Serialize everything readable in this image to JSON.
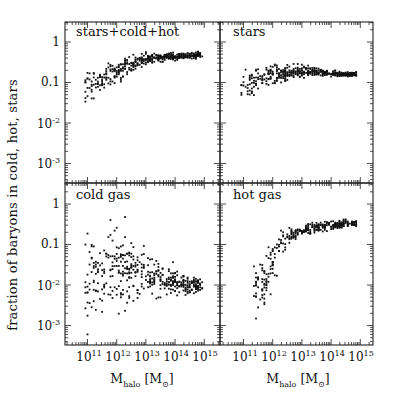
{
  "chart_data": {
    "type": "scatter",
    "layout": "2x2 panels, shared axes",
    "ylabel": "fraction of baryons in cold, hot, stars",
    "xlabel": "M_halo [M_sun]",
    "xscale": "log",
    "yscale": "log",
    "xlim": [
      30000000000.0,
      1000000000000000.0
    ],
    "ylim": [
      0.0003,
      3
    ],
    "x_ticks": [
      "10^11",
      "10^12",
      "10^13",
      "10^14",
      "10^15"
    ],
    "y_ticks": [
      "1",
      "0.1",
      "10^-2",
      "10^-3"
    ],
    "panels": [
      {
        "name": "stars+cold+hot",
        "position": "top-left",
        "trend_log10M": [
          10.9,
          11.5,
          12.0,
          12.5,
          13.0,
          13.5,
          14.0,
          14.5,
          14.9
        ],
        "trend_median": [
          0.08,
          0.12,
          0.18,
          0.27,
          0.38,
          0.42,
          0.45,
          0.47,
          0.48
        ],
        "scatter_dex": [
          0.2,
          0.18,
          0.15,
          0.1,
          0.08,
          0.06,
          0.05,
          0.04,
          0.04
        ]
      },
      {
        "name": "stars",
        "position": "top-right",
        "trend_log10M": [
          10.9,
          11.5,
          12.0,
          12.5,
          13.0,
          13.5,
          14.0,
          14.5,
          14.9
        ],
        "trend_median": [
          0.07,
          0.11,
          0.15,
          0.17,
          0.19,
          0.18,
          0.17,
          0.16,
          0.16
        ],
        "scatter_dex": [
          0.2,
          0.15,
          0.12,
          0.1,
          0.08,
          0.05,
          0.04,
          0.03,
          0.03
        ]
      },
      {
        "name": "cold gas",
        "position": "bottom-left",
        "trend_log10M": [
          10.9,
          11.5,
          12.0,
          12.5,
          13.0,
          13.5,
          14.0,
          14.5,
          14.9
        ],
        "trend_median": [
          0.01,
          0.02,
          0.03,
          0.025,
          0.018,
          0.014,
          0.012,
          0.01,
          0.01
        ],
        "scatter_dex": [
          0.6,
          0.55,
          0.5,
          0.45,
          0.35,
          0.25,
          0.18,
          0.12,
          0.1
        ]
      },
      {
        "name": "hot gas",
        "position": "bottom-right",
        "trend_log10M": [
          11.3,
          11.7,
          12.0,
          12.3,
          12.7,
          13.0,
          13.5,
          14.0,
          14.5,
          14.9
        ],
        "trend_median": [
          0.006,
          0.01,
          0.04,
          0.12,
          0.18,
          0.22,
          0.27,
          0.3,
          0.32,
          0.33
        ],
        "scatter_dex": [
          0.3,
          0.35,
          0.35,
          0.15,
          0.1,
          0.08,
          0.07,
          0.06,
          0.05,
          0.05
        ]
      }
    ]
  },
  "labels": {
    "ylabel": "fraction of baryons in cold, hot, stars",
    "xlabel_main": "M",
    "xlabel_sub": "halo",
    "xlabel_unit_open": " [M",
    "xlabel_unit_sym": "⊙",
    "xlabel_unit_close": "]",
    "panel_titles": [
      "stars+cold+hot",
      "stars",
      "cold gas",
      "hot gas"
    ],
    "ytick_plain": [
      "1",
      "0.1"
    ],
    "ytick_exp": [
      "-2",
      "-3"
    ],
    "xtick_base": "10",
    "xtick_exp": [
      "11",
      "12",
      "13",
      "14",
      "15"
    ]
  }
}
